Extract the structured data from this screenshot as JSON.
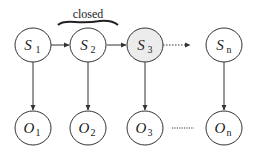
{
  "diagram": {
    "annotation": {
      "label": "closed",
      "spans": [
        "S1",
        "S2"
      ]
    },
    "state_nodes": [
      {
        "id": "S1",
        "symbol": "S",
        "subscript": "1",
        "shaded": false
      },
      {
        "id": "S2",
        "symbol": "S",
        "subscript": "2",
        "shaded": false
      },
      {
        "id": "S3",
        "symbol": "S",
        "subscript": "3",
        "shaded": true
      },
      {
        "id": "Sn",
        "symbol": "S",
        "subscript": "n",
        "shaded": false
      }
    ],
    "observation_nodes": [
      {
        "id": "O1",
        "symbol": "O",
        "subscript": "1"
      },
      {
        "id": "O2",
        "symbol": "O",
        "subscript": "2"
      },
      {
        "id": "O3",
        "symbol": "O",
        "subscript": "3"
      },
      {
        "id": "On",
        "symbol": "O",
        "subscript": "n"
      }
    ],
    "edges": [
      {
        "from": "S1",
        "to": "S2",
        "style": "solid"
      },
      {
        "from": "S2",
        "to": "S3",
        "style": "solid"
      },
      {
        "from": "S3",
        "to": "Sn",
        "style": "dotted"
      },
      {
        "from": "S1",
        "to": "O1",
        "style": "solid"
      },
      {
        "from": "S2",
        "to": "O2",
        "style": "solid"
      },
      {
        "from": "S3",
        "to": "O3",
        "style": "solid"
      },
      {
        "from": "Sn",
        "to": "On",
        "style": "solid"
      },
      {
        "from": "O3",
        "to": "On",
        "style": "dotted",
        "arrow": false
      }
    ],
    "colors": {
      "stroke": "#333333",
      "shaded_fill": "#ececec",
      "fill": "#ffffff"
    }
  }
}
